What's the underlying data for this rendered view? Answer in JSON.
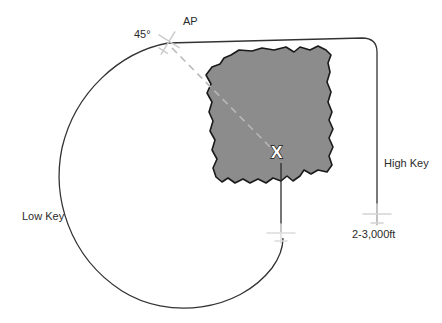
{
  "diagram": {
    "labels": {
      "ap": "AP",
      "angle": "45°",
      "high_key": "High Key",
      "low_key": "Low Key",
      "altitude": "2-3,000ft",
      "target": "X"
    },
    "colors": {
      "field_fill": "#8c8c8c",
      "field_stroke": "#1a1a1a",
      "track_line": "#2b2b2b",
      "dashed_line": "#b3b3b3",
      "aircraft_ap": "#cfcfcf",
      "aircraft_high_key": "#d8d8d8",
      "aircraft_low_key": "#e2e2e2",
      "text": "#2b2b2b",
      "background": "#ffffff"
    },
    "elements": {
      "field_shape_name": "irregular-landing-field",
      "aircraft_count": 3,
      "track_description": "closed circuit with rounded top-right corner and long left-hand curve"
    }
  }
}
